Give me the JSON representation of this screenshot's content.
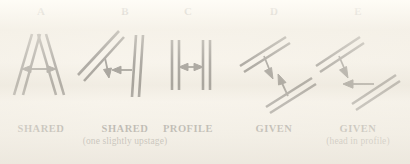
{
  "figure": {
    "background_color": "#f3efe6",
    "ink_color": "#15120e",
    "panels": [
      {
        "letter": "A",
        "caption_main": "SHARED",
        "caption_sub": "",
        "diagram_name": "two-bars-converging-top-with-double-arrow"
      },
      {
        "letter": "B",
        "caption_main": "SHARED",
        "caption_sub": "(one slightly upstage)",
        "diagram_name": "tilted-bar-and-vertical-bar-with-arrows"
      },
      {
        "letter": "C",
        "caption_main": "PROFILE",
        "caption_sub": "",
        "diagram_name": "two-vertical-bars-with-double-arrow"
      },
      {
        "letter": "D",
        "caption_main": "GIVEN",
        "caption_sub": "",
        "diagram_name": "two-offset-diagonal-bars-with-down-arrows"
      },
      {
        "letter": "E",
        "caption_main": "GIVEN",
        "caption_sub": "(head in profile)",
        "diagram_name": "two-offset-diagonal-bars-down-arrow-and-left-arrow"
      }
    ]
  }
}
